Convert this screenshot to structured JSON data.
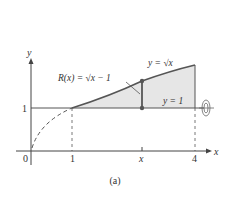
{
  "figure": {
    "caption": "(a)",
    "axes": {
      "x_label": "x",
      "y_label": "y",
      "x_ticks": [
        "0",
        "1",
        "x",
        "4"
      ],
      "y_ticks": [
        "1"
      ]
    },
    "labels": {
      "curve": "y = √x",
      "line": "y = 1",
      "radius": "R(x) = √x − 1"
    },
    "colors": {
      "curve": "#555555",
      "fill": "#e6e6e6",
      "axis": "#444444",
      "point": "#555555"
    },
    "rotation_icon": "rotation-about-y1-icon"
  }
}
